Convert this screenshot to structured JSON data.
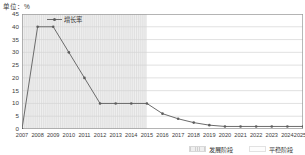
{
  "chart_data": {
    "type": "line",
    "title": "",
    "subtitle": "",
    "unit_label": "单位：%",
    "xlabel": "",
    "ylabel": "",
    "x_axis_suffix": "年",
    "grid": true,
    "legend_position": "top-left-inside",
    "ylim": [
      0,
      45
    ],
    "y_ticks": [
      0,
      5,
      10,
      15,
      20,
      25,
      30,
      35,
      40,
      45
    ],
    "y_tick_labels": [
      "0",
      "5",
      "10",
      "15",
      "20",
      "25",
      "30",
      "35",
      "40",
      "45"
    ],
    "categories": [
      "2007",
      "2008",
      "2009",
      "2010",
      "2011",
      "2012",
      "2013",
      "2014",
      "2015",
      "2016",
      "2017",
      "2018",
      "2019",
      "2020",
      "2021",
      "2022",
      "2023",
      "2024",
      "2025"
    ],
    "series": [
      {
        "name": "增长率",
        "color": "#6b6b6b",
        "marker_color": "#5d5d5d",
        "values": [
          0,
          40,
          40,
          30,
          20,
          10,
          10,
          10,
          10,
          6,
          4,
          2.5,
          1.5,
          1,
          1,
          1,
          1,
          1,
          1
        ]
      }
    ],
    "shaded_regions": [
      {
        "name": "发展阶段",
        "from": "2007",
        "to": "2015",
        "fill": "#e8e8e8",
        "style": "hatched"
      },
      {
        "name": "平稳阶段",
        "from": "2015",
        "to": "2025",
        "fill": "#ffffff",
        "style": "plain"
      }
    ],
    "annotations": []
  },
  "legend": {
    "series_label": "增长率",
    "phases": [
      {
        "label": "发展阶段"
      },
      {
        "label": "平稳阶段"
      }
    ]
  },
  "colors": {
    "line": "#6b6b6b",
    "marker": "#5d5d5d",
    "grid": "#d4d4d4",
    "axis": "#9a9a9a",
    "text": "#3a3a3a",
    "shaded": "#e8e8e8",
    "plain": "#ffffff"
  }
}
